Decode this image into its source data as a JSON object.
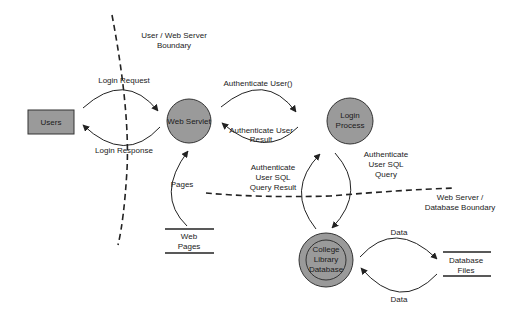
{
  "diagram": {
    "type": "data-flow-diagram",
    "colors": {
      "node_fill": "#9a9a9a",
      "stroke": "#222222",
      "background": "#ffffff"
    },
    "entities": [
      {
        "id": "users",
        "label": "Users",
        "shape": "rectangle"
      }
    ],
    "processes": [
      {
        "id": "web_servlet",
        "label": "Web Servlet",
        "shape": "circle"
      },
      {
        "id": "login_process",
        "label_lines": [
          "Login",
          "Process"
        ],
        "shape": "circle"
      },
      {
        "id": "college_db",
        "label_lines": [
          "College",
          "Library",
          "Database"
        ],
        "shape": "double-circle"
      }
    ],
    "stores": [
      {
        "id": "web_pages",
        "label_lines": [
          "Web",
          "Pages"
        ]
      },
      {
        "id": "db_files",
        "label_lines": [
          "Database",
          "Files"
        ]
      }
    ],
    "flows": [
      {
        "from": "users",
        "to": "web_servlet",
        "label": "Login Request"
      },
      {
        "from": "web_servlet",
        "to": "users",
        "label": "Login Response"
      },
      {
        "from": "web_servlet",
        "to": "login_process",
        "label": "Authenticate User()"
      },
      {
        "from": "login_process",
        "to": "web_servlet",
        "label_lines": [
          "Authenticate User",
          "Result"
        ]
      },
      {
        "from": "web_pages",
        "to": "web_servlet",
        "label": "Pages"
      },
      {
        "from": "login_process",
        "to": "college_db",
        "label_lines": [
          "Authenticate",
          "User SQL",
          "Query"
        ]
      },
      {
        "from": "college_db",
        "to": "login_process",
        "label_lines": [
          "Authenticate",
          "User SQL",
          "Query Result"
        ]
      },
      {
        "from": "college_db",
        "to": "db_files",
        "label": "Data"
      },
      {
        "from": "db_files",
        "to": "college_db",
        "label": "Data"
      }
    ],
    "boundaries": [
      {
        "id": "user_web",
        "label_lines": [
          "User / Web Server",
          "Boundary"
        ]
      },
      {
        "id": "web_db",
        "label_lines": [
          "Web Server /",
          "Database Boundary"
        ]
      }
    ]
  }
}
